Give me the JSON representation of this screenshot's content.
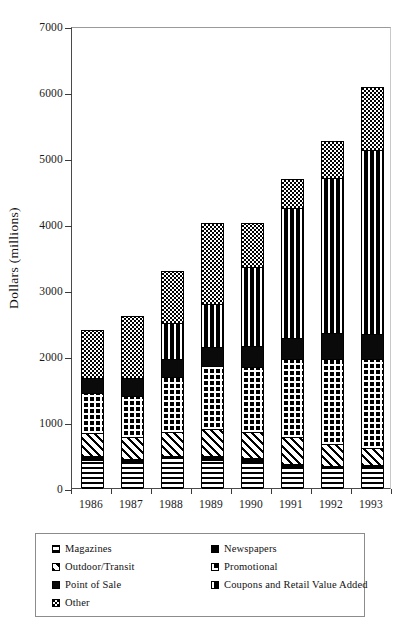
{
  "figure": {
    "background": "#ffffff",
    "ink_color": "#000000"
  },
  "axes": {
    "y_title": "Dollars (millions)",
    "y_ticks": [
      "0",
      "1000",
      "2000",
      "3000",
      "4000",
      "5000",
      "6000",
      "7000"
    ],
    "x_ticks": [
      "1986",
      "1987",
      "1988",
      "1989",
      "1990",
      "1991",
      "1992",
      "1993"
    ]
  },
  "legend": {
    "items": [
      {
        "label": "Magazines",
        "pattern": "horizontal-lines",
        "swatch_class": "p-hlines",
        "col": 0,
        "row": 0
      },
      {
        "label": "Newspapers",
        "pattern": "solid-black",
        "swatch_class": "p-solid",
        "col": 1,
        "row": 0
      },
      {
        "label": "Outdoor/Transit",
        "pattern": "diagonal-hatch",
        "swatch_class": "p-diag",
        "col": 0,
        "row": 1
      },
      {
        "label": "Promotional",
        "pattern": "grid-hatch",
        "swatch_class": "p-grid",
        "col": 1,
        "row": 1
      },
      {
        "label": "Point of Sale",
        "pattern": "solid-black",
        "swatch_class": "p-black2",
        "col": 0,
        "row": 2
      },
      {
        "label": "Coupons and Retail Value Added",
        "pattern": "vertical-lines",
        "swatch_class": "p-vlines",
        "col": 1,
        "row": 2
      },
      {
        "label": "Other",
        "pattern": "checkerboard",
        "swatch_class": "p-checker",
        "col": 0,
        "row": 3
      }
    ]
  },
  "caption": "",
  "chart_data": {
    "type": "bar",
    "stacked": true,
    "title": "",
    "xlabel": "",
    "ylabel": "Dollars (millions)",
    "ylim": [
      0,
      7000
    ],
    "ytick_step": 1000,
    "grid": false,
    "legend_position": "below",
    "categories": [
      "1986",
      "1987",
      "1988",
      "1989",
      "1990",
      "1991",
      "1992",
      "1993"
    ],
    "series": [
      {
        "name": "Magazines",
        "pattern": "horizontal-lines",
        "values": [
          430,
          400,
          450,
          430,
          400,
          320,
          300,
          310
        ]
      },
      {
        "name": "Newspapers",
        "pattern": "solid-black",
        "values": [
          50,
          40,
          40,
          50,
          50,
          40,
          40,
          40
        ]
      },
      {
        "name": "Outdoor/Transit",
        "pattern": "diagonal-hatch",
        "values": [
          360,
          340,
          360,
          420,
          400,
          420,
          330,
          250
        ]
      },
      {
        "name": "Promotional",
        "pattern": "grid-hatch",
        "values": [
          600,
          620,
          830,
          950,
          980,
          1170,
          1280,
          1360
        ]
      },
      {
        "name": "Point of Sale",
        "pattern": "solid-black",
        "values": [
          230,
          260,
          280,
          280,
          320,
          320,
          400,
          380
        ]
      },
      {
        "name": "Coupons and Retail Value Added",
        "pattern": "vertical-lines",
        "values": [
          0,
          0,
          540,
          660,
          1200,
          1970,
          2350,
          2780
        ]
      },
      {
        "name": "Other",
        "pattern": "checkerboard",
        "values": [
          720,
          940,
          790,
          1220,
          670,
          440,
          560,
          950
        ]
      }
    ],
    "totals": [
      2390,
      2600,
      3290,
      4010,
      4020,
      4680,
      5260,
      6070
    ],
    "units": "millions of dollars"
  }
}
